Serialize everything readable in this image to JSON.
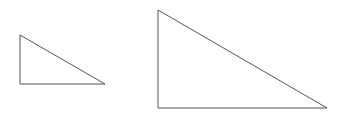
{
  "diagram": {
    "background": "#ffffff",
    "stroke_color": "#555555",
    "stroke_width": 1,
    "shapes": [
      {
        "name": "small-right-triangle",
        "type": "right-triangle",
        "points": [
          [
            20,
            35
          ],
          [
            20,
            84
          ],
          [
            105,
            84
          ]
        ]
      },
      {
        "name": "large-right-triangle",
        "type": "right-triangle",
        "points": [
          [
            158,
            10
          ],
          [
            158,
            108
          ],
          [
            327,
            108
          ]
        ]
      }
    ]
  }
}
